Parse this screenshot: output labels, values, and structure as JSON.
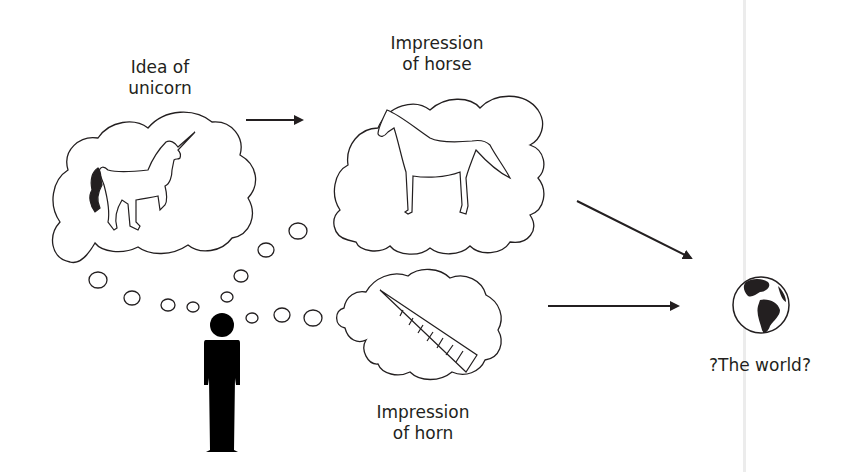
{
  "diagram": {
    "nodes": {
      "unicorn_idea": {
        "label_line1": "Idea of",
        "label_line2": "unicorn",
        "content": "unicorn-drawing"
      },
      "horse_impression": {
        "label_line1": "Impression",
        "label_line2": "of horse",
        "content": "horse-drawing"
      },
      "horn_impression": {
        "label_line1": "Impression",
        "label_line2": "of horn",
        "content": "horn-drawing"
      },
      "world": {
        "label": "?The world?",
        "content": "globe-icon"
      },
      "person": {
        "content": "person-silhouette"
      }
    },
    "edges": [
      {
        "from": "unicorn_idea",
        "to": "horse_impression",
        "type": "arrow"
      },
      {
        "from": "horse_impression",
        "to": "world",
        "type": "arrow"
      },
      {
        "from": "horn_impression",
        "to": "world",
        "type": "arrow"
      },
      {
        "from": "person",
        "to": "unicorn_idea",
        "type": "thought-bubbles"
      },
      {
        "from": "person",
        "to": "horse_impression",
        "type": "thought-bubbles"
      },
      {
        "from": "person",
        "to": "horn_impression",
        "type": "thought-bubbles"
      }
    ],
    "colors": {
      "ink": "#231f20",
      "background": "#ffffff",
      "divider": "#ececec"
    }
  }
}
